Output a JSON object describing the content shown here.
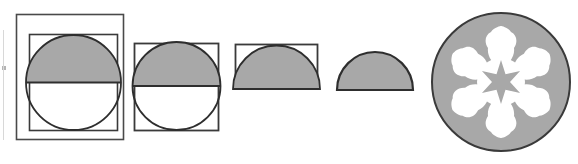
{
  "document": {
    "title": "Geometric figure sequence: inscribed circle reduction to semicircle and rosette",
    "background_color": "#ffffff",
    "width": 578,
    "height": 164
  },
  "palette": {
    "shade_gray": "#a8a8a8",
    "outline_dark": "#3a3a3a",
    "outline_mid": "#555555",
    "white": "#ffffff",
    "edge_artifact": "#b4b4b4"
  },
  "figures": [
    {
      "id": "figure-1",
      "name": "outer-square-inner-square-half-shaded-circle",
      "label": "Figure 1",
      "description": "Outer square containing an inner square with an inscribed circle whose upper half is shaded gray",
      "outer_square": {
        "x": 16,
        "y": 14,
        "width": 108,
        "height": 126
      },
      "inner_square": {
        "x": 29,
        "y": 34,
        "width": 89,
        "height": 97
      },
      "circle": {
        "cx": 73.5,
        "cy": 82.5,
        "r": 47.5
      },
      "shaded_half": "top",
      "diameter_line_y": 82.5
    },
    {
      "id": "figure-2",
      "name": "square-with-half-shaded-circle",
      "label": "Figure 2",
      "description": "Single square with an inscribed circle whose upper half is shaded gray",
      "square": {
        "x": 134,
        "y": 43,
        "width": 85,
        "height": 88
      },
      "circle": {
        "cx": 176.5,
        "cy": 86,
        "r": 44
      },
      "shaded_half": "top",
      "diameter_line_y": 86
    },
    {
      "id": "figure-3",
      "name": "rectangle-with-shaded-semicircle",
      "label": "Figure 3",
      "description": "Half-height rectangle containing a gray filled semicircle resting on the rectangle base",
      "rectangle": {
        "x": 235,
        "y": 44,
        "width": 83,
        "height": 45
      },
      "semicircle": {
        "cx": 276.5,
        "cy": 89,
        "r": 43.5
      },
      "shaded": true
    },
    {
      "id": "figure-4",
      "name": "shaded-semicircle",
      "label": "Figure 4",
      "description": "Standalone gray filled semicircle with dark outline and no bounding rectangle",
      "semicircle": {
        "cx": 375,
        "cy": 90,
        "r": 38
      },
      "shaded": true
    },
    {
      "id": "figure-5",
      "name": "gray-disc-with-white-six-petal-rosette",
      "label": "Figure 5",
      "description": "Gray disc with a white six petal rosette cut out and a small gray six pointed star at the centre",
      "disc": {
        "cx": 501,
        "cy": 82,
        "r": 69
      },
      "rosette": {
        "petals": 6,
        "color": "#ffffff",
        "outer_radius": 52,
        "petal_width": 22
      },
      "center_star": {
        "points": 6,
        "color": "#a8a8a8",
        "outer_radius": 22,
        "inner_radius": 9
      }
    }
  ],
  "artifacts": {
    "left_edge_mark": {
      "x": 2,
      "y": 66,
      "width": 4,
      "height": 4,
      "name": "scan-edge-speck"
    }
  }
}
